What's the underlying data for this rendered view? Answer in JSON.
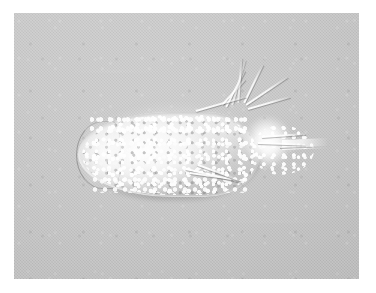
{
  "figure": {
    "kind": "light-micrograph",
    "modality": "phase-contrast / DIC brightfield",
    "caption": "",
    "scale_bar": "",
    "annotations": []
  },
  "plate": {
    "background_color": "#c3c3c3",
    "page_color": "#ffffff",
    "left": 14,
    "top": 13,
    "width": 345,
    "height": 266
  },
  "organism": {
    "label": "ciliate-cell",
    "body_color": "#f2f2f2",
    "outline_color": "#6e6e6e",
    "halo_color": "#ffffff",
    "anterior": "left-rounded",
    "posterior": "right-tapered",
    "parts": [
      {
        "name": "anterior-cap",
        "label": "anterior rounded end"
      },
      {
        "name": "cytoplasm-granules",
        "label": "granular cytoplasm"
      },
      {
        "name": "posterior-lobe",
        "label": "posterior granular lobe"
      },
      {
        "name": "bright-halo",
        "label": "over-exposed posterior halo"
      },
      {
        "name": "caudal-tail",
        "label": "caudal projection"
      }
    ],
    "cirri": [
      {
        "name": "dorsal-cirrus-1",
        "left": 222,
        "top": 104,
        "length": 34,
        "angle": -48
      },
      {
        "name": "dorsal-cirrus-2",
        "left": 226,
        "top": 106,
        "length": 40,
        "angle": -63
      },
      {
        "name": "dorsal-cirrus-3",
        "left": 232,
        "top": 104,
        "length": 46,
        "angle": -74
      },
      {
        "name": "dorsal-cirrus-4",
        "left": 238,
        "top": 102,
        "length": 44,
        "angle": -86
      },
      {
        "name": "dorsal-cirrus-5",
        "left": 244,
        "top": 102,
        "length": 42,
        "angle": -64
      },
      {
        "name": "dorsal-cirrus-6",
        "left": 246,
        "top": 104,
        "length": 50,
        "angle": -34
      },
      {
        "name": "dorsal-cirrus-7",
        "left": 248,
        "top": 108,
        "length": 44,
        "angle": -16
      },
      {
        "name": "dorsal-cirrus-8",
        "left": 196,
        "top": 110,
        "length": 52,
        "angle": -16
      },
      {
        "name": "ventral-cirrus-1",
        "left": 186,
        "top": 168,
        "length": 58,
        "angle": 13
      },
      {
        "name": "ventral-cirrus-2",
        "left": 190,
        "top": 172,
        "length": 52,
        "angle": 8
      },
      {
        "name": "ventral-cirrus-3",
        "left": 198,
        "top": 164,
        "length": 42,
        "angle": 20
      },
      {
        "name": "caudal-cirrus-1",
        "left": 262,
        "top": 136,
        "length": 44,
        "angle": -4
      },
      {
        "name": "caudal-cirrus-2",
        "left": 258,
        "top": 142,
        "length": 48,
        "angle": 2
      }
    ]
  }
}
